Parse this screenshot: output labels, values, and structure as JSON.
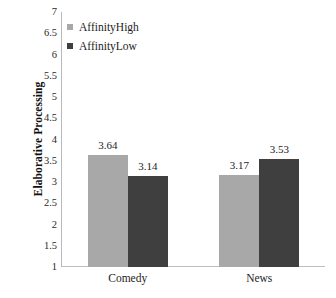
{
  "chart_data": {
    "type": "bar",
    "title": "",
    "xlabel": "",
    "ylabel": "Elaborative Processing",
    "categories": [
      "Comedy",
      "News"
    ],
    "series": [
      {
        "name": "AffinityHigh",
        "color": "#a8a8a8",
        "values": [
          3.64,
          3.17
        ]
      },
      {
        "name": "AffinityLow",
        "color": "#3f3f3f",
        "values": [
          3.14,
          3.53
        ]
      }
    ],
    "value_labels": [
      [
        "3.64",
        "3.14"
      ],
      [
        "3.17",
        "3.53"
      ]
    ],
    "ylim": [
      1,
      7
    ],
    "ytick_step": 0.5,
    "yticks": [
      "7",
      "6.5",
      "6",
      "5.5",
      "5",
      "4.5",
      "4",
      "3.5",
      "3",
      "2.5",
      "2",
      "1.5",
      "1"
    ],
    "grid": false,
    "legend_position": "top-left-inside"
  },
  "legend": {
    "items": [
      {
        "label": "AffinityHigh",
        "swatch": "high"
      },
      {
        "label": "AffinityLow",
        "swatch": "low"
      }
    ]
  },
  "axis": {
    "y_title": "Elaborative Processing",
    "x_categories": [
      "Comedy",
      "News"
    ]
  }
}
